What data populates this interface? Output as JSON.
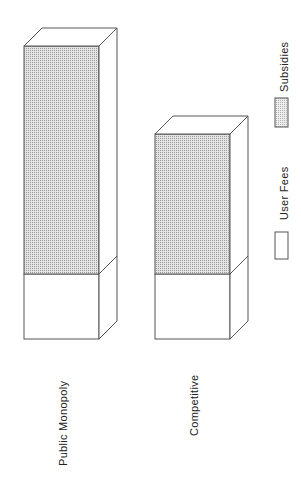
{
  "chart_data": {
    "type": "bar",
    "style": "3d-stacked-rotated",
    "orientation": "rotated-90-ccw",
    "title": "",
    "xlabel": "",
    "ylabel": "",
    "categories": [
      "Public Monopoly",
      "Competitive"
    ],
    "series": [
      {
        "name": "User Fees",
        "values": [
          65,
          65
        ],
        "fill": "#ffffff",
        "pattern": "none"
      },
      {
        "name": "Subsidies",
        "values": [
          228,
          140
        ],
        "fill": "#d9d9d9",
        "pattern": "dots"
      }
    ],
    "units": "relative (no axis shown)",
    "grid": false,
    "legend": {
      "position": "right",
      "entries": [
        "Subsidies",
        "User Fees"
      ]
    }
  },
  "labels": {
    "cat0": "Public Monopoly",
    "cat1": "Competitive",
    "legend_subsidies": "Subsidies",
    "legend_user_fees": "User Fees"
  },
  "colors": {
    "stroke": "#555555",
    "dot": "#9a9a9a",
    "background": "#ffffff"
  }
}
